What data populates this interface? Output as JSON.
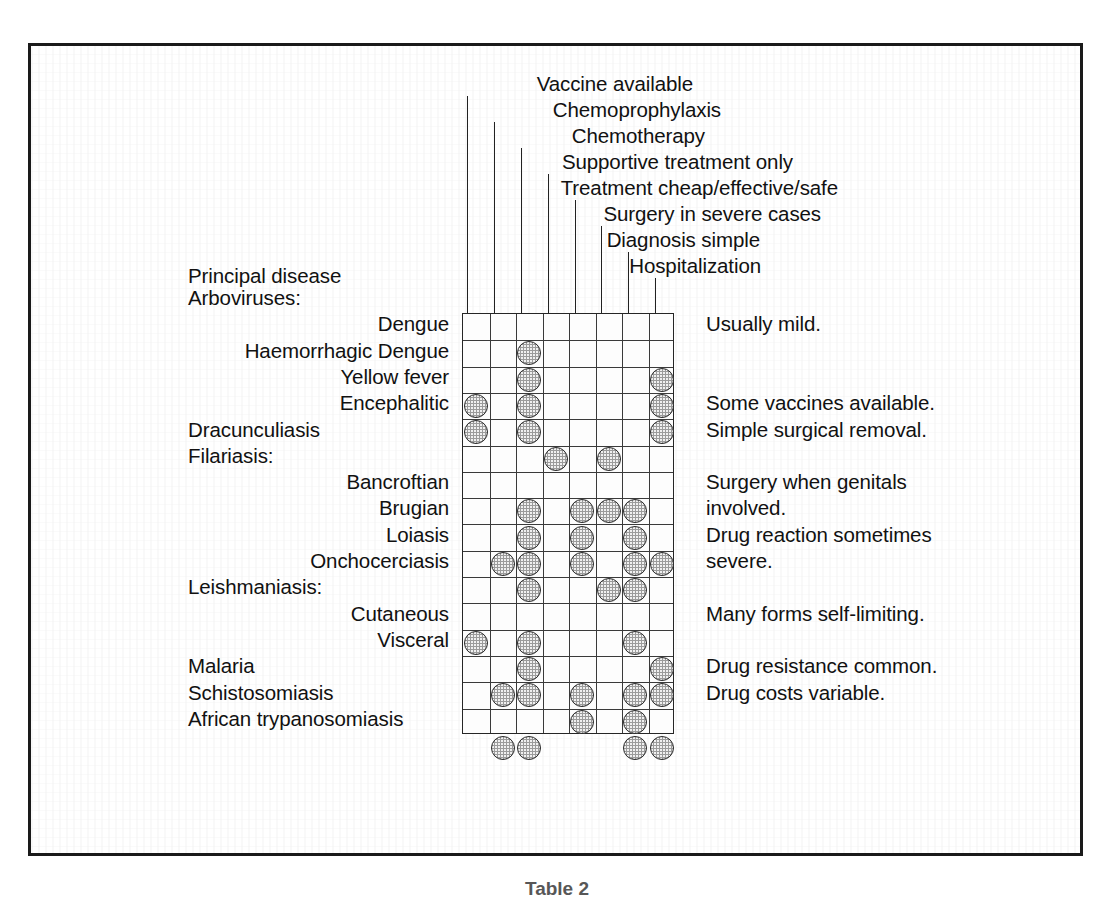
{
  "figure": {
    "caption": "Table 2",
    "row_header_label": "Principal disease"
  },
  "columns": [
    {
      "id": "vaccine",
      "label": "Vaccine available"
    },
    {
      "id": "chemoprophylaxis",
      "label": "Chemoprophylaxis"
    },
    {
      "id": "chemotherapy",
      "label": "Chemotherapy"
    },
    {
      "id": "supportive",
      "label": "Supportive treatment only"
    },
    {
      "id": "cheap",
      "label": "Treatment cheap/effective/safe"
    },
    {
      "id": "surgery",
      "label": "Surgery in severe cases"
    },
    {
      "id": "diagnosis",
      "label": "Diagnosis simple"
    },
    {
      "id": "hospital",
      "label": "Hospitalization"
    }
  ],
  "rows": [
    {
      "label": "Arboviruses:",
      "indent": "left",
      "group": true,
      "marks": []
    },
    {
      "label": "Dengue",
      "indent": "right",
      "group": false,
      "marks": [
        3
      ]
    },
    {
      "label": "Haemorrhagic Dengue",
      "indent": "right",
      "group": false,
      "marks": [
        3,
        8
      ]
    },
    {
      "label": "Yellow fever",
      "indent": "right",
      "group": false,
      "marks": [
        1,
        3,
        8
      ]
    },
    {
      "label": "Encephalitic",
      "indent": "right",
      "group": false,
      "marks": [
        1,
        3,
        8
      ]
    },
    {
      "label": "Dracunculiasis",
      "indent": "left",
      "group": false,
      "marks": [
        4,
        6
      ]
    },
    {
      "label": "Filariasis:",
      "indent": "left",
      "group": true,
      "marks": []
    },
    {
      "label": "Bancroftian",
      "indent": "right",
      "group": false,
      "marks": [
        3,
        5,
        6,
        7
      ]
    },
    {
      "label": "Brugian",
      "indent": "right",
      "group": false,
      "marks": [
        3,
        5,
        7
      ]
    },
    {
      "label": "Loiasis",
      "indent": "right",
      "group": false,
      "marks": [
        2,
        3,
        5,
        7,
        8
      ]
    },
    {
      "label": "Onchocerciasis",
      "indent": "right",
      "group": false,
      "marks": [
        3,
        6,
        7
      ]
    },
    {
      "label": "Leishmaniasis:",
      "indent": "left",
      "group": true,
      "marks": []
    },
    {
      "label": "Cutaneous",
      "indent": "right",
      "group": false,
      "marks": [
        1,
        3,
        7
      ]
    },
    {
      "label": "Visceral",
      "indent": "right",
      "group": false,
      "marks": [
        3,
        8
      ]
    },
    {
      "label": "Malaria",
      "indent": "left",
      "group": false,
      "marks": [
        2,
        3,
        5,
        7,
        8
      ]
    },
    {
      "label": "Schistosomiasis",
      "indent": "left",
      "group": false,
      "marks": [
        5,
        7
      ]
    },
    {
      "label": "African  trypanosomiasis",
      "indent": "left",
      "group": false,
      "marks": [
        2,
        3,
        7,
        8
      ]
    }
  ],
  "notes": [
    {
      "text": "Usually mild.",
      "row": 1
    },
    {
      "text": "Some vaccines available.",
      "row": 4
    },
    {
      "text": "Simple surgical removal.",
      "row": 5
    },
    {
      "text": "Surgery when genitals",
      "row": 7
    },
    {
      "text": "involved.",
      "row": 8
    },
    {
      "text": "Drug reaction sometimes",
      "row": 9
    },
    {
      "text": "severe.",
      "row": 10
    },
    {
      "text": "Many forms self-limiting.",
      "row": 12
    },
    {
      "text": "Drug resistance common.",
      "row": 14
    },
    {
      "text": "Drug costs variable.",
      "row": 15
    }
  ],
  "chart_data": {
    "type": "table",
    "title": "Table 2",
    "xlabel": "Management / treatment attribute",
    "ylabel": "Principal disease",
    "grid": true,
    "legend": "filled circle = attribute applies",
    "categories": [
      "Vaccine available",
      "Chemoprophylaxis",
      "Chemotherapy",
      "Supportive treatment only",
      "Treatment cheap/effective/safe",
      "Surgery in severe cases",
      "Diagnosis simple",
      "Hospitalization"
    ],
    "series": [
      {
        "name": "Dengue",
        "values": [
          0,
          0,
          1,
          0,
          0,
          0,
          0,
          0
        ]
      },
      {
        "name": "Haemorrhagic Dengue",
        "values": [
          0,
          0,
          1,
          0,
          0,
          0,
          0,
          1
        ]
      },
      {
        "name": "Yellow fever",
        "values": [
          1,
          0,
          1,
          0,
          0,
          0,
          0,
          1
        ]
      },
      {
        "name": "Encephalitic",
        "values": [
          1,
          0,
          1,
          0,
          0,
          0,
          0,
          1
        ]
      },
      {
        "name": "Dracunculiasis",
        "values": [
          0,
          0,
          0,
          1,
          0,
          1,
          0,
          0
        ]
      },
      {
        "name": "Bancroftian",
        "values": [
          0,
          0,
          1,
          0,
          1,
          1,
          1,
          0
        ]
      },
      {
        "name": "Brugian",
        "values": [
          0,
          0,
          1,
          0,
          1,
          0,
          1,
          0
        ]
      },
      {
        "name": "Loiasis",
        "values": [
          0,
          1,
          1,
          0,
          1,
          0,
          1,
          1
        ]
      },
      {
        "name": "Onchocerciasis",
        "values": [
          0,
          0,
          1,
          0,
          0,
          1,
          1,
          0
        ]
      },
      {
        "name": "Cutaneous",
        "values": [
          1,
          0,
          1,
          0,
          0,
          0,
          1,
          0
        ]
      },
      {
        "name": "Visceral",
        "values": [
          0,
          0,
          1,
          0,
          0,
          0,
          0,
          1
        ]
      },
      {
        "name": "Malaria",
        "values": [
          0,
          1,
          1,
          0,
          1,
          0,
          1,
          1
        ]
      },
      {
        "name": "Schistosomiasis",
        "values": [
          0,
          0,
          0,
          0,
          1,
          0,
          1,
          0
        ]
      },
      {
        "name": "African trypanosomiasis",
        "values": [
          0,
          1,
          1,
          0,
          0,
          0,
          1,
          1
        ]
      }
    ],
    "annotations": [
      "Dengue: Usually mild.",
      "Encephalitic: Some vaccines available.",
      "Dracunculiasis: Simple surgical removal.",
      "Bancroftian/Brugian: Surgery when genitals involved.",
      "Loiasis/Onchocerciasis: Drug reaction sometimes severe.",
      "Cutaneous leishmaniasis: Many forms self-limiting.",
      "Malaria: Drug resistance common.",
      "Schistosomiasis: Drug costs variable."
    ]
  }
}
